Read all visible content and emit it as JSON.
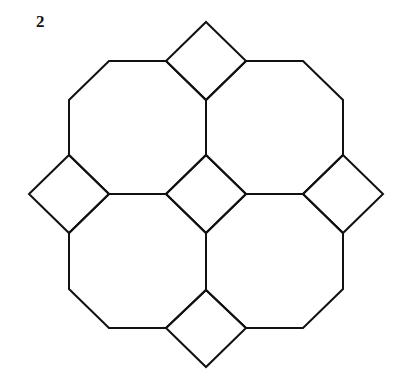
{
  "figure": {
    "label": "2",
    "stroke_color": "#111111",
    "stroke_width": 2,
    "fill_color": "#ffffff"
  },
  "diagram": {
    "octagons": [
      {
        "id": "octagon-top-left",
        "points": "109,61 166,61 206,100 206,155 166,194 109,194 69,155 69,100"
      },
      {
        "id": "octagon-top-right",
        "points": "246,61 303,61 343,100 343,155 303,194 246,194 206,155 206,100"
      },
      {
        "id": "octagon-bottom-left",
        "points": "109,194 166,194 206,233 206,290 166,328 109,328 69,289 69,233"
      },
      {
        "id": "octagon-bottom-right",
        "points": "246,194 303,194 343,233 343,289 303,328 246,328 206,290 206,233"
      }
    ],
    "squares": [
      {
        "id": "square-top",
        "points": "206,22 246,61 206,100 166,61"
      },
      {
        "id": "square-center",
        "points": "206,155 246,194 206,233 166,194"
      },
      {
        "id": "square-left",
        "points": "69,155 109,194 69,233 29,194"
      },
      {
        "id": "square-right",
        "points": "343,155 383,194 343,233 303,194"
      },
      {
        "id": "square-bottom",
        "points": "206,290 246,328 206,367 166,328"
      }
    ]
  }
}
